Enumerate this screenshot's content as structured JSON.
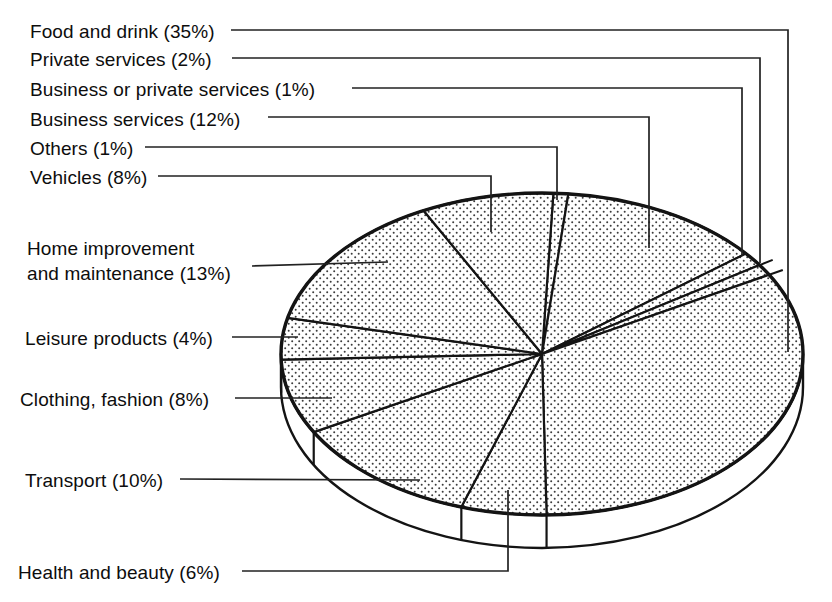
{
  "figure": {
    "background": "#ffffff",
    "ink_color": "#141414",
    "leader_color": "#222222",
    "stipple_dot_color": "#3c3c3c"
  },
  "chart_data": {
    "type": "pie",
    "projection": "3d-disk",
    "fill_style": "halftone-stipple",
    "title": "",
    "unit": "%",
    "total": 100,
    "legend_position": "left-labels-with-leader-lines",
    "slices": [
      {
        "label": "Food and drink",
        "value": 35
      },
      {
        "label": "Private services",
        "value": 2
      },
      {
        "label": "Business or private services",
        "value": 1
      },
      {
        "label": "Business services",
        "value": 12
      },
      {
        "label": "Others",
        "value": 1
      },
      {
        "label": "Vehicles",
        "value": 8
      },
      {
        "label": "Home improvement and maintenance",
        "value": 13
      },
      {
        "label": "Leisure products",
        "value": 4
      },
      {
        "label": "Clothing, fashion",
        "value": 8
      },
      {
        "label": "Transport",
        "value": 10
      },
      {
        "label": "Health and beauty",
        "value": 6
      }
    ],
    "layout": {
      "center": [
        542,
        354
      ],
      "rx": 261,
      "ry": 161,
      "depth": 33,
      "angles_note": "degrees clockwise from 12 o'clock, as drawn in the scan",
      "slice_arcs": [
        {
          "slice": "Others",
          "a0": 2.5,
          "a1": 5.8
        },
        {
          "slice": "Business services",
          "a0": 5.8,
          "a1": 51.4
        },
        {
          "slice": "Business or private services",
          "a0": 51.4,
          "a1": 56.5
        },
        {
          "slice": "Private services",
          "a0": 56.5,
          "a1": 60.5
        },
        {
          "slice": "Food and drink",
          "a0": 60.5,
          "a1": 179
        },
        {
          "slice": "Health and beauty",
          "a0": 179,
          "a1": 198
        },
        {
          "slice": "Transport",
          "a0": 198,
          "a1": 241
        },
        {
          "slice": "Clothing, fashion",
          "a0": 241,
          "a1": 268
        },
        {
          "slice": "Leisure products",
          "a0": 268,
          "a1": 283
        },
        {
          "slice": "Home improvement and maintenance",
          "a0": 283,
          "a1": 333
        },
        {
          "slice": "Vehicles",
          "a0": 333,
          "a1": 362.5
        }
      ],
      "overshoot_angles": [
        56.5,
        60.5
      ],
      "rim_tick_angles": [
        179,
        198,
        241,
        268
      ]
    },
    "labels": [
      {
        "slice": "Food and drink",
        "lines": [
          "Food and drink (35%)"
        ],
        "x": 30,
        "y": 19,
        "leader": [
          [
            231,
            30
          ],
          [
            788,
            30
          ],
          [
            788,
            352
          ]
        ]
      },
      {
        "slice": "Private services",
        "lines": [
          "Private services (2%)"
        ],
        "x": 30,
        "y": 47,
        "leader": [
          [
            232,
            58
          ],
          [
            760,
            58
          ],
          [
            760,
            263
          ]
        ]
      },
      {
        "slice": "Business or private services",
        "lines": [
          "Business or private services (1%)"
        ],
        "x": 30,
        "y": 77,
        "leader": [
          [
            352,
            88
          ],
          [
            742,
            88
          ],
          [
            742,
            256
          ]
        ]
      },
      {
        "slice": "Business services",
        "lines": [
          "Business services (12%)"
        ],
        "x": 30,
        "y": 107,
        "leader": [
          [
            268,
            117
          ],
          [
            649,
            117
          ],
          [
            649,
            248
          ]
        ]
      },
      {
        "slice": "Others",
        "lines": [
          "Others (1%)"
        ],
        "x": 30,
        "y": 136,
        "leader": [
          [
            145,
            147
          ],
          [
            557,
            147
          ],
          [
            557,
            200
          ]
        ]
      },
      {
        "slice": "Vehicles",
        "lines": [
          "Vehicles (8%)"
        ],
        "x": 30,
        "y": 165,
        "leader": [
          [
            158,
            176
          ],
          [
            491,
            176
          ],
          [
            491,
            232
          ]
        ]
      },
      {
        "slice": "Home improvement and maintenance",
        "lines": [
          "Home improvement",
          "and maintenance (13%)"
        ],
        "x": 27,
        "y": 236,
        "leader": [
          [
            252,
            266
          ],
          [
            388,
            262
          ]
        ]
      },
      {
        "slice": "Leisure products",
        "lines": [
          "Leisure products (4%)"
        ],
        "x": 25,
        "y": 326,
        "leader": [
          [
            232,
            337
          ],
          [
            298,
            337
          ]
        ]
      },
      {
        "slice": "Clothing, fashion",
        "lines": [
          "Clothing, fashion (8%)"
        ],
        "x": 20,
        "y": 387,
        "leader": [
          [
            235,
            398
          ],
          [
            332,
            398
          ]
        ]
      },
      {
        "slice": "Transport",
        "lines": [
          "Transport (10%)"
        ],
        "x": 25,
        "y": 468,
        "leader": [
          [
            180,
            479
          ],
          [
            420,
            480
          ]
        ]
      },
      {
        "slice": "Health and beauty",
        "lines": [
          "Health and beauty (6%)"
        ],
        "x": 18,
        "y": 560,
        "leader": [
          [
            242,
            571
          ],
          [
            508,
            571
          ],
          [
            508,
            490
          ]
        ]
      }
    ]
  }
}
